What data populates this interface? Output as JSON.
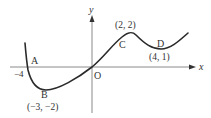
{
  "figure": {
    "type": "function-graph",
    "axes": {
      "x_label": "x",
      "y_label": "y",
      "origin_label": "O",
      "x_intercept_label": "−4"
    },
    "points": [
      {
        "name": "A",
        "coords_label": "",
        "x": -4,
        "y": 0
      },
      {
        "name": "B",
        "coords_label": "(−3, −2)",
        "x": -3,
        "y": -2
      },
      {
        "name": "C",
        "coords_label": "(2, 2)",
        "x": 2,
        "y": 2
      },
      {
        "name": "D",
        "coords_label": "(4, 1)",
        "x": 4,
        "y": 1
      }
    ],
    "colors": {
      "axis": "#8a8a8a",
      "curve": "#2a2a2a",
      "text": "#333333"
    }
  }
}
